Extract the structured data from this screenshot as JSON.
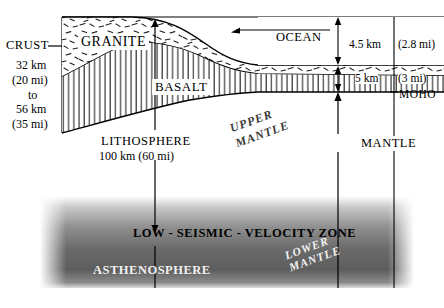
{
  "figure": {
    "type": "geologic-cross-section"
  },
  "left_axis": {
    "crust_label": "CRUST",
    "lines": [
      "32 km",
      "(20 mi)",
      "to",
      "56 km",
      "(35 mi)"
    ]
  },
  "layers": {
    "granite": "GRANITE",
    "basalt": "BASALT",
    "ocean": "OCEAN",
    "moho": "MOHO",
    "mantle": "MANTLE",
    "upper_mantle_line1": "UPPER",
    "upper_mantle_line2": "MANTLE",
    "lower_mantle_line1": "LOWER",
    "lower_mantle_line2": "MANTLE",
    "asthenosphere": "ASTHENOSPHERE",
    "low_velocity_zone": "LOW - SEISMIC - VELOCITY  ZONE"
  },
  "lithosphere": {
    "name": "LITHOSPHERE",
    "depth": "100 km (60 mi)"
  },
  "ocean_depth": {
    "km": "4.5 km",
    "mi": "(2.8 mi)"
  },
  "oceanic_crust": {
    "km": "5 km",
    "mi": "(3 mi)"
  },
  "colors": {
    "ink": "#000000",
    "paper": "#ffffff",
    "asthenosphere_dark": "#5a5a5a",
    "label_light": "#f2f2f2"
  }
}
